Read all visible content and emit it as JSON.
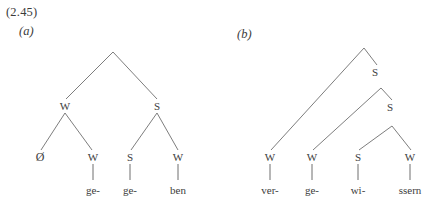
{
  "figure": {
    "example_number": "(2.45)",
    "line_color": "#6e6e6e",
    "text_color": "#3d3d3d",
    "background_color": "#ffffff"
  },
  "trees": [
    {
      "id": "tree-a",
      "label": "(a)",
      "nodes": [
        {
          "name": "root",
          "text": "",
          "x": 113,
          "y": 51
        },
        {
          "name": "left-branch",
          "text": "W",
          "x": 65,
          "y": 106
        },
        {
          "name": "right-branch",
          "text": "S",
          "x": 157,
          "y": 106
        }
      ],
      "leaves": [
        {
          "name": "leaf-1",
          "label": "Ø",
          "word": "",
          "x": 40,
          "y": 157
        },
        {
          "name": "leaf-2",
          "label": "W",
          "word": "ge-",
          "x": 93,
          "y": 157
        },
        {
          "name": "leaf-3",
          "label": "S",
          "word": "ge-",
          "x": 130,
          "y": 157
        },
        {
          "name": "leaf-4",
          "label": "W",
          "word": "ben",
          "x": 178,
          "y": 157
        }
      ],
      "word_y": 190
    },
    {
      "id": "tree-b",
      "label": "(b)",
      "nodes": [
        {
          "name": "root",
          "text": "",
          "x": 364,
          "y": 47
        },
        {
          "name": "node-s1",
          "text": "S",
          "x": 375,
          "y": 72
        },
        {
          "name": "node-s2",
          "text": "S",
          "x": 390,
          "y": 107
        }
      ],
      "leaves": [
        {
          "name": "leaf-1",
          "label": "W",
          "word": "ver-",
          "x": 270,
          "y": 157
        },
        {
          "name": "leaf-2",
          "label": "W",
          "word": "ge-",
          "x": 312,
          "y": 157
        },
        {
          "name": "leaf-3",
          "label": "S",
          "word": "wi-",
          "x": 358,
          "y": 157
        },
        {
          "name": "leaf-4",
          "label": "W",
          "word": "ssern",
          "x": 410,
          "y": 157
        }
      ],
      "word_y": 190
    }
  ]
}
